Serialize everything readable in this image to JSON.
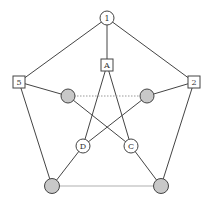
{
  "diagram": {
    "nodes": [
      {
        "id": "n1",
        "label": "1",
        "shape": "circle",
        "fill": "#ffffff",
        "x": 107,
        "y": 18
      },
      {
        "id": "nA",
        "label": "A",
        "shape": "square",
        "fill": "#ffffff",
        "x": 107,
        "y": 65
      },
      {
        "id": "n5",
        "label": "5",
        "shape": "square",
        "fill": "#ffffff",
        "x": 19,
        "y": 82
      },
      {
        "id": "n2",
        "label": "2",
        "shape": "square",
        "fill": "#ffffff",
        "x": 194,
        "y": 82
      },
      {
        "id": "gL",
        "label": "",
        "shape": "circle",
        "fill": "#c8c8c8",
        "x": 68,
        "y": 96
      },
      {
        "id": "gR",
        "label": "",
        "shape": "circle",
        "fill": "#c8c8c8",
        "x": 147,
        "y": 96
      },
      {
        "id": "nD",
        "label": "D",
        "shape": "circle",
        "fill": "#ffffff",
        "x": 83,
        "y": 146
      },
      {
        "id": "nC",
        "label": "C",
        "shape": "circle",
        "fill": "#ffffff",
        "x": 131,
        "y": 146
      },
      {
        "id": "gBL",
        "label": "",
        "shape": "circle",
        "fill": "#c8c8c8",
        "x": 52,
        "y": 186
      },
      {
        "id": "gBR",
        "label": "",
        "shape": "circle",
        "fill": "#c8c8c8",
        "x": 161,
        "y": 186
      }
    ],
    "labels": {
      "n1": "1",
      "nA": "A",
      "n5": "5",
      "n2": "2",
      "nD": "D",
      "nC": "C"
    },
    "colors": {
      "stroke": "#444444",
      "gray_fill": "#c8c8c8",
      "light_edge": "#b0b0b0"
    }
  }
}
